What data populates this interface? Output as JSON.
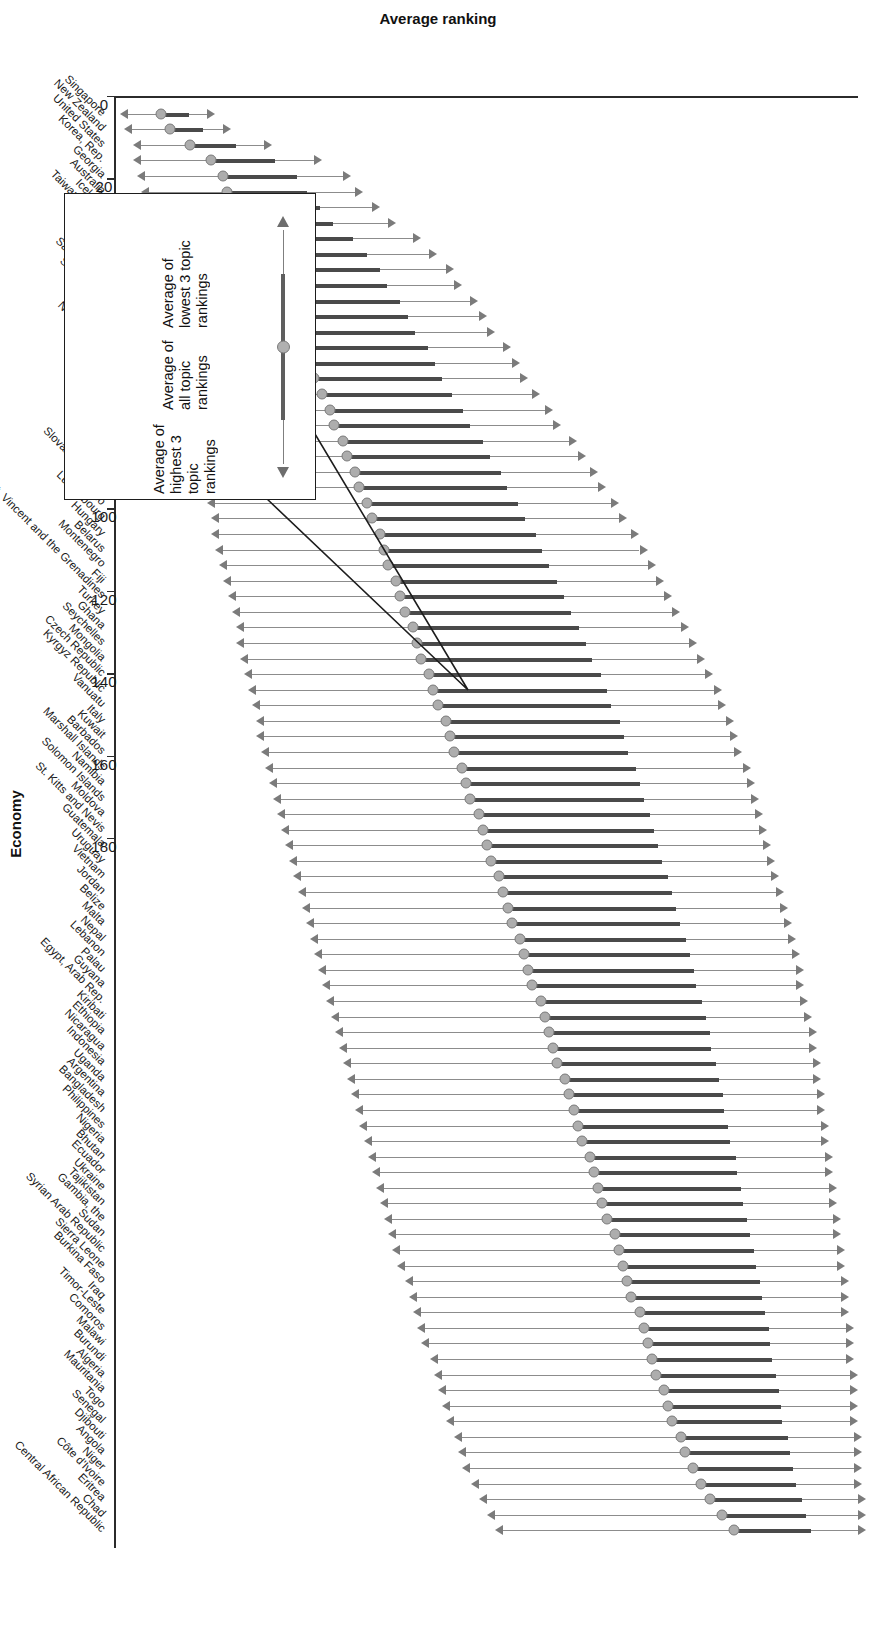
{
  "axes": {
    "y_title": "Average ranking",
    "x_title": "Economy",
    "y_ticks": [
      "0",
      "20",
      "40",
      "60",
      "80",
      "100",
      "120",
      "140",
      "160",
      "180"
    ]
  },
  "callout": {
    "lowest_label": "Average of\nlowest 3 topic\nrankings",
    "all_label": "Average of\nall topic\nrankings",
    "highest_label": "Average of\nhighest 3\ntopic rankings"
  },
  "chart_data": {
    "type": "bar",
    "title": "",
    "xlabel": "Economy",
    "ylabel": "Average ranking",
    "ylim": [
      0,
      180
    ],
    "grid": false,
    "legend": [
      "Average of lowest 3 topic rankings",
      "Average of all topic rankings",
      "Average of highest 3 topic rankings"
    ],
    "series_names": [
      "low",
      "mean",
      "high"
    ],
    "note": "Each economy shows an arrow range: upper arrow = average of lowest 3 topic rankings, marker = average of all topic rankings, lower arrow = average of highest 3 topic rankings.",
    "categories": [
      "Singapore",
      "New Zealand",
      "United States",
      "Korea, Rep.",
      "Georgia",
      "Australia",
      "Iceland",
      "Taiwan, China",
      "Mauritius",
      "Estonia",
      "Germany",
      "Saudi Arabia",
      "Switzerland",
      "Latvia",
      "Japan",
      "Netherlands",
      "Slovenia",
      "Belgium",
      "Bahrain",
      "Armenia",
      "Oman",
      "Peru",
      "Rwanda",
      "Israel",
      "Slovak Republic",
      "Mexico",
      "Luxembourg",
      "Hungary",
      "Belarus",
      "Montenegro",
      "Fiji",
      "St. Vincent and the Grenadines",
      "Turkey",
      "Ghana",
      "Seychelles",
      "Mongolia",
      "Czech Republic",
      "Kyrgyz Republic",
      "Vanuatu",
      "Italy",
      "Kuwait",
      "Barbados",
      "Marshall Islands",
      "Namibia",
      "Solomon Islands",
      "Moldova",
      "St. Kitts and Nevis",
      "Guatemala",
      "Uruguay",
      "Vietnam",
      "Jordan",
      "Belize",
      "Malta",
      "Nepal",
      "Lebanon",
      "Palau",
      "Guyana",
      "Egypt, Arab Rep.",
      "Kiribati",
      "Ethiopia",
      "Nicaragua",
      "Indonesia",
      "Uganda",
      "Argentina",
      "Bangladesh",
      "Philippines",
      "Nigeria",
      "Bhutan",
      "Ecuador",
      "Ukraine",
      "Tajikistan",
      "Gambia, the",
      "Sudan",
      "Syrian Arab Republic",
      "Sierra Leone",
      "Burkina Faso",
      "Iraq",
      "Timor-Leste",
      "Comoros",
      "Malawi",
      "Burundi",
      "Algeria",
      "Mauritania",
      "Togo",
      "Senegal",
      "Djibouti",
      "Angola",
      "Niger",
      "Côte d'Ivoire",
      "Eritrea",
      "Chad",
      "Central African Republic"
    ],
    "series": [
      {
        "name": "Average of highest 3 topic rankings",
        "values": [
          3,
          4,
          6,
          6,
          7,
          8,
          9,
          10,
          11,
          12,
          12,
          13,
          14,
          15,
          15,
          16,
          17,
          18,
          18,
          19,
          20,
          21,
          21,
          22,
          23,
          24,
          25,
          25,
          26,
          27,
          28,
          29,
          30,
          31,
          31,
          32,
          33,
          34,
          35,
          36,
          36,
          37,
          38,
          39,
          40,
          41,
          42,
          43,
          44,
          45,
          46,
          47,
          48,
          49,
          50,
          51,
          52,
          53,
          54,
          55,
          56,
          57,
          58,
          59,
          60,
          61,
          62,
          63,
          64,
          65,
          66,
          67,
          68,
          69,
          70,
          72,
          73,
          74,
          75,
          76,
          78,
          79,
          80,
          81,
          82,
          84,
          85,
          86,
          88,
          90,
          92,
          94
        ]
      },
      {
        "name": "Average of all topic rankings",
        "values": [
          11,
          13,
          18,
          23,
          26,
          27,
          29,
          31,
          34,
          36,
          38,
          39,
          41,
          43,
          44,
          46,
          47,
          48,
          50,
          52,
          53,
          55,
          56,
          58,
          59,
          61,
          62,
          64,
          65,
          66,
          68,
          69,
          70,
          72,
          73,
          74,
          76,
          77,
          78,
          80,
          81,
          82,
          84,
          85,
          86,
          88,
          89,
          90,
          91,
          93,
          94,
          95,
          96,
          98,
          99,
          100,
          101,
          103,
          104,
          105,
          106,
          107,
          109,
          110,
          111,
          112,
          113,
          115,
          116,
          117,
          118,
          119,
          121,
          122,
          123,
          124,
          125,
          127,
          128,
          129,
          130,
          131,
          133,
          134,
          135,
          137,
          138,
          140,
          142,
          144,
          147,
          150
        ]
      },
      {
        "name": "Average of lowest 3 topic rankings",
        "values": [
          22,
          26,
          36,
          48,
          55,
          58,
          62,
          66,
          72,
          76,
          80,
          82,
          86,
          88,
          90,
          94,
          96,
          98,
          101,
          104,
          106,
          110,
          112,
          115,
          117,
          120,
          122,
          125,
          127,
          129,
          131,
          133,
          135,
          137,
          139,
          141,
          143,
          145,
          146,
          148,
          149,
          150,
          152,
          153,
          154,
          155,
          156,
          157,
          158,
          159,
          160,
          161,
          162,
          163,
          164,
          165,
          165,
          166,
          167,
          168,
          168,
          169,
          169,
          170,
          170,
          171,
          171,
          172,
          172,
          173,
          173,
          174,
          174,
          175,
          175,
          176,
          176,
          176,
          177,
          177,
          177,
          178,
          178,
          178,
          178,
          179,
          179,
          179,
          179,
          180,
          180,
          180
        ]
      }
    ]
  }
}
